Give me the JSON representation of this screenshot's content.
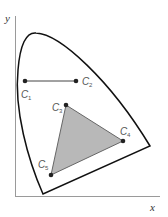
{
  "diagram": {
    "type": "chromaticity-diagram",
    "axes": {
      "x_label": "x",
      "y_label": "y",
      "color": "#999999"
    },
    "locus": {
      "name": "spectral-locus",
      "stroke": "#111111"
    },
    "points": [
      {
        "id": "C1",
        "letter": "C",
        "sub": "1",
        "x": 25,
        "y": 81
      },
      {
        "id": "C2",
        "letter": "C",
        "sub": "2",
        "x": 76,
        "y": 81
      },
      {
        "id": "C3",
        "letter": "C",
        "sub": "3",
        "x": 66,
        "y": 105
      },
      {
        "id": "C4",
        "letter": "C",
        "sub": "4",
        "x": 123,
        "y": 141
      },
      {
        "id": "C5",
        "letter": "C",
        "sub": "5",
        "x": 51,
        "y": 175
      }
    ],
    "segment": {
      "from": "C1",
      "to": "C2",
      "color": "#444444"
    },
    "triangle": {
      "vertices": [
        "C3",
        "C4",
        "C5"
      ],
      "fill": "#b8b8b8",
      "stroke": "#666666"
    },
    "point_color": "#222222"
  }
}
